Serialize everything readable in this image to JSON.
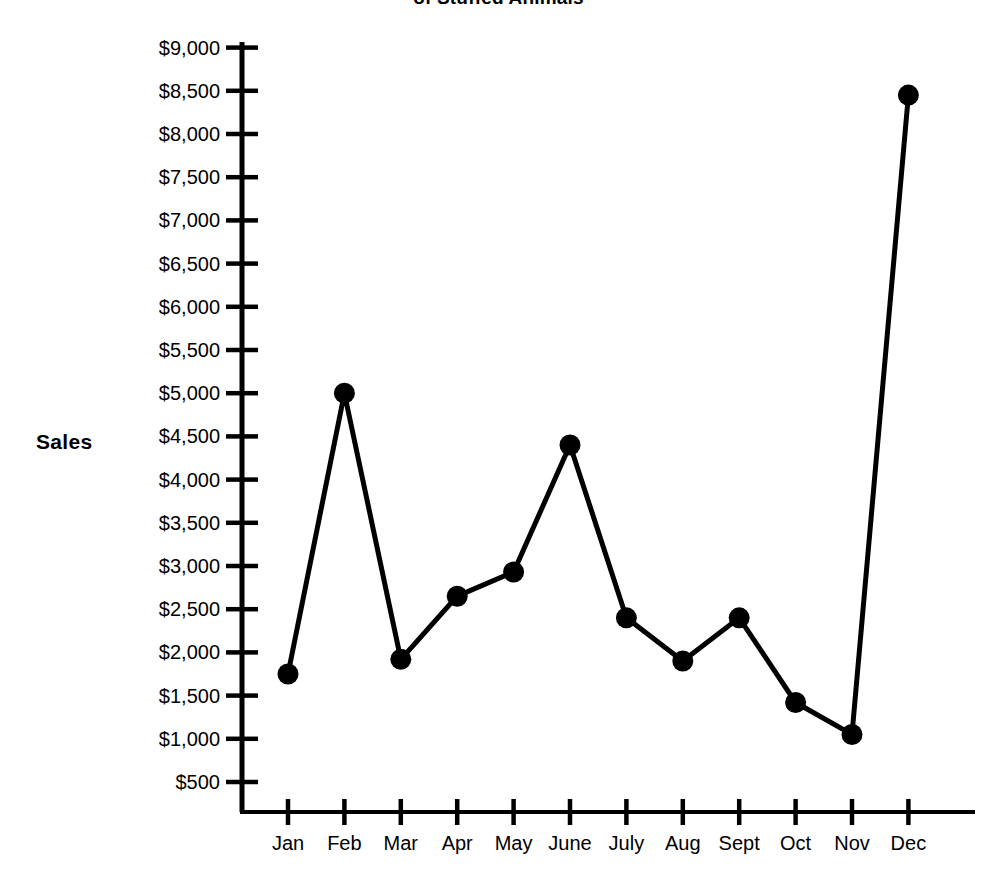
{
  "chart_data": {
    "type": "line",
    "title": "of Stuffed Animals",
    "title_note": "Title is clipped at the top edge of the screenshot; only the lower portion of the first line is visible.",
    "xlabel": "",
    "ylabel": "Sales",
    "categories": [
      "Jan",
      "Feb",
      "Mar",
      "Apr",
      "May",
      "June",
      "July",
      "Aug",
      "Sept",
      "Oct",
      "Nov",
      "Dec"
    ],
    "values": [
      1750,
      5000,
      1920,
      2650,
      2930,
      4400,
      2400,
      1900,
      2400,
      1420,
      1050,
      8450
    ],
    "ytick_labels": [
      "$9,000",
      "$8,500",
      "$8,000",
      "$7,500",
      "$7,000",
      "$6,500",
      "$6,000",
      "$5,500",
      "$5,000",
      "$4,500",
      "$4,000",
      "$3,500",
      "$3,000",
      "$2,500",
      "$2,000",
      "$1,500",
      "$1,000",
      "$500"
    ],
    "ytick_values": [
      9000,
      8500,
      8000,
      7500,
      7000,
      6500,
      6000,
      5500,
      5000,
      4500,
      4000,
      3500,
      3000,
      2500,
      2000,
      1500,
      1000,
      500
    ],
    "ylim": [
      0,
      9250
    ],
    "grid": false,
    "legend": false,
    "marker": "filled-circle",
    "line_color": "#000000",
    "marker_color": "#000000",
    "background_color": "#ffffff"
  }
}
